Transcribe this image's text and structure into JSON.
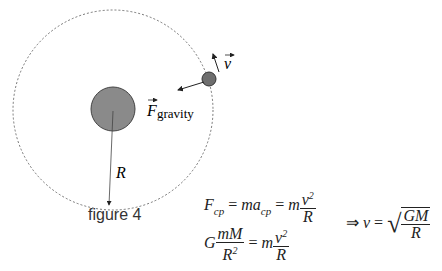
{
  "figure": {
    "caption": "figure 4",
    "labels": {
      "velocity": "v",
      "force": "F",
      "force_subscript": "gravity",
      "radius": "R"
    },
    "colors": {
      "planet": "#8a8a8a",
      "moon": "#6e6e6e",
      "orbit": "#555555"
    }
  },
  "equations": {
    "eq1": {
      "lhs": "F",
      "lhs_sub": "cp",
      "mid": "ma",
      "mid_sub": "cp",
      "rhs_m": "m",
      "num": "v",
      "num_sup": "2",
      "den": "R"
    },
    "eq2": {
      "G": "G",
      "num": "mM",
      "den": "R",
      "den_sup": "2",
      "rhs_m": "m",
      "rnum": "v",
      "rnum_sup": "2",
      "rden": "R"
    },
    "result": {
      "arrow": "⇒",
      "v": "v",
      "num": "GM",
      "den": "R"
    }
  }
}
